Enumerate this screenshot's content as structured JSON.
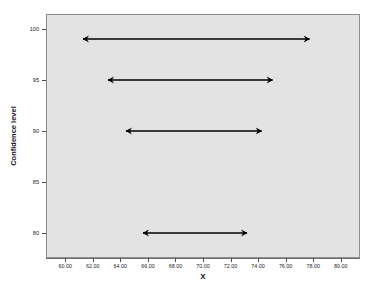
{
  "chart_data": {
    "type": "line",
    "title": "",
    "xlabel": "X",
    "ylabel": "Confidence level",
    "xlim": [
      58.6,
      81.4
    ],
    "ylim": [
      77.5,
      101.5
    ],
    "grid": false,
    "legend": "none",
    "x_ticks": [
      60,
      62,
      64,
      66,
      68,
      70,
      72,
      74,
      76,
      78,
      80
    ],
    "x_tick_labels": [
      "60.00",
      "62.00",
      "64.00",
      "66.00",
      "68.00",
      "70.00",
      "72.00",
      "74.00",
      "76.00",
      "78.00",
      "80.00"
    ],
    "y_ticks": [
      80,
      85,
      90,
      95,
      100
    ],
    "y_tick_labels": [
      "80",
      "85",
      "90",
      "95",
      "100"
    ],
    "series_name": "Confidence intervals",
    "marker": "double-headed-arrow",
    "intervals": [
      {
        "label": "99% interval",
        "confidence": 99,
        "lower": 61.2,
        "upper": 77.8,
        "width": 16.6,
        "center": 69.5
      },
      {
        "label": "95% interval",
        "confidence": 95,
        "lower": 63.0,
        "upper": 75.1,
        "width": 12.1,
        "center": 69.05
      },
      {
        "label": "90% interval",
        "confidence": 90,
        "lower": 64.3,
        "upper": 74.3,
        "width": 10.0,
        "center": 69.3
      },
      {
        "label": "80% interval",
        "confidence": 80,
        "lower": 65.6,
        "upper": 73.3,
        "width": 7.7,
        "center": 69.45
      }
    ],
    "colors": {
      "plot_background": "#e3e3e3",
      "page_background": "#ffffff",
      "arrow": "#000000",
      "axis": "#6f6f6f",
      "text": "#1d1d1d"
    }
  }
}
